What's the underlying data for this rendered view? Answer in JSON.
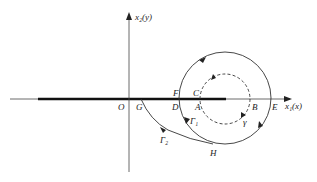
{
  "diagram": {
    "axes": {
      "x_label": "x₁(x)",
      "y_label": "x₂(y)",
      "origin_label": "O"
    },
    "points": {
      "G": "G",
      "D": "D",
      "F": "F",
      "A": "A",
      "C": "C",
      "B": "B",
      "E": "E",
      "H": "H"
    },
    "curves": {
      "gamma1": "Γ₁",
      "gamma2": "Γ₂",
      "gamma": "γ"
    },
    "colors": {
      "line": "#222222",
      "background": "#ffffff"
    }
  }
}
